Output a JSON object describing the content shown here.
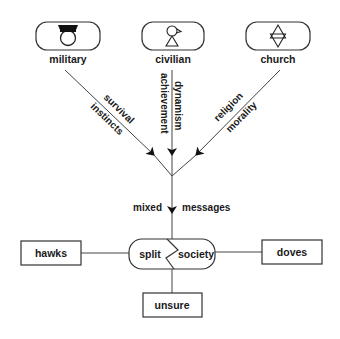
{
  "diagram": {
    "sources": [
      {
        "id": "military",
        "label": "military",
        "icon": "military-cap-icon"
      },
      {
        "id": "civilian",
        "label": "civilian",
        "icon": "person-icon"
      },
      {
        "id": "church",
        "label": "church",
        "icon": "star-of-david-icon"
      }
    ],
    "edges": {
      "military": [
        "survival",
        "instincts"
      ],
      "civilian": [
        "dynamism",
        "achievement"
      ],
      "church": [
        "religion",
        "morality"
      ],
      "combined": [
        "mixed",
        "messages"
      ]
    },
    "center": {
      "left": "split",
      "right": "society"
    },
    "outcomes": {
      "left": "hawks",
      "right": "doves",
      "bottom": "unsure"
    }
  },
  "colors": {
    "stroke": "#333333",
    "text": "#1a1a1a",
    "background": "#ffffff"
  }
}
